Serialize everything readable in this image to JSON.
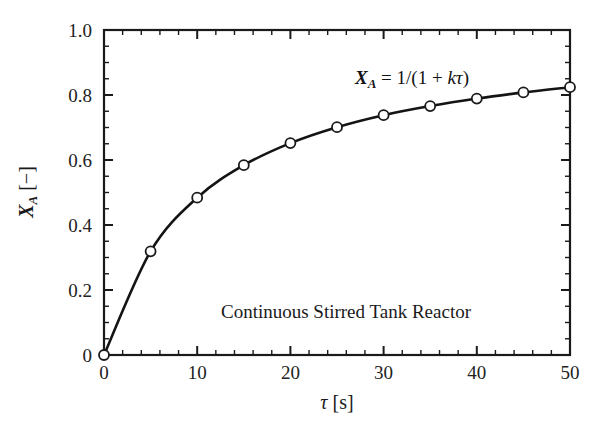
{
  "figure": {
    "background_color": "#ffffff",
    "axis_color": "#1a1a1a",
    "curve_color": "#141414",
    "marker_face_color": "#ffffff",
    "marker_edge_color": "#1a1a1a"
  },
  "chart_data": {
    "type": "line",
    "title": "",
    "xlabel": "τ [s]",
    "ylabel": "X_A [−]",
    "xlim": [
      0,
      50
    ],
    "ylim": [
      0,
      1.0
    ],
    "grid": false,
    "legend_position": "none",
    "x_major_ticks": [
      0,
      10,
      20,
      30,
      40,
      50
    ],
    "x_tick_labels": [
      "0",
      "10",
      "20",
      "30",
      "40",
      "50"
    ],
    "x_minor_interval": 2,
    "y_major_ticks": [
      0,
      0.2,
      0.4,
      0.6,
      0.8,
      1.0
    ],
    "y_tick_labels": [
      "0",
      "0.2",
      "0.4",
      "0.6",
      "0.8",
      "1.0"
    ],
    "y_minor_interval": 0.05,
    "tick_direction": "in",
    "series": [
      {
        "name": "Continuous Stirred Tank Reactor",
        "marker": "open-circle",
        "x": [
          0,
          5,
          10,
          15,
          20,
          25,
          30,
          35,
          40,
          45,
          50
        ],
        "values": [
          0.0,
          0.319,
          0.484,
          0.584,
          0.652,
          0.701,
          0.738,
          0.766,
          0.789,
          0.808,
          0.824
        ]
      }
    ],
    "annotations": [
      {
        "name": "equation",
        "text": "X_A = 1/(1 + kτ)",
        "x": 27.0,
        "y": 0.895
      },
      {
        "name": "reactor-type",
        "text": "Continuous Stirred Tank Reactor",
        "x": 25.5,
        "y": 0.175
      }
    ]
  },
  "labels": {
    "x_axis_symbol": "τ",
    "x_axis_unit": "[s]",
    "y_axis_symbol": "X",
    "y_axis_subscript": "A",
    "y_axis_unit": "[−]",
    "equation_lhs": "X",
    "equation_lhs_sub": "A",
    "equation_rhs": " = 1/(1 + ",
    "equation_k": "k",
    "equation_tau": "τ",
    "equation_close": ")",
    "reactor_caption": "Continuous Stirred Tank Reactor"
  },
  "ticks": {
    "x": [
      "0",
      "10",
      "20",
      "30",
      "40",
      "50"
    ],
    "y": [
      "0",
      "0.2",
      "0.4",
      "0.6",
      "0.8",
      "1.0"
    ]
  }
}
